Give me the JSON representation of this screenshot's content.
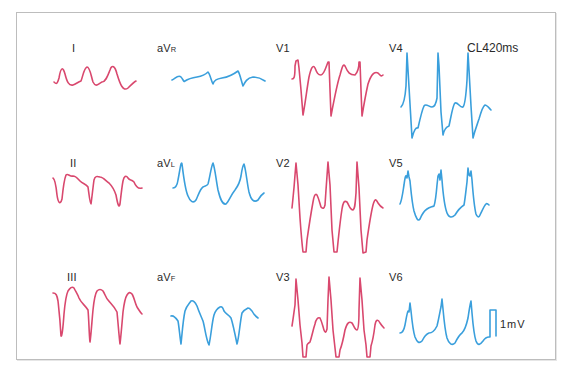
{
  "figure": {
    "cycle_length_label": "CL420ms",
    "calibration_label": "1mV",
    "colors": {
      "limb_and_right_precordial": "#d9486e",
      "augmented_and_left_precordial": "#3a9fdc",
      "frame_border": "#bdbdbd",
      "text": "#2a2a2a"
    }
  },
  "leads": [
    {
      "id": "I",
      "main": "I",
      "sub": "",
      "color": "red"
    },
    {
      "id": "aVR",
      "main": "aV",
      "sub": "R",
      "color": "blue"
    },
    {
      "id": "V1",
      "main": "V1",
      "sub": "",
      "color": "red"
    },
    {
      "id": "V4",
      "main": "V4",
      "sub": "",
      "color": "blue"
    },
    {
      "id": "II",
      "main": "II",
      "sub": "",
      "color": "red"
    },
    {
      "id": "aVL",
      "main": "aV",
      "sub": "L",
      "color": "blue"
    },
    {
      "id": "V2",
      "main": "V2",
      "sub": "",
      "color": "red"
    },
    {
      "id": "V5",
      "main": "V5",
      "sub": "",
      "color": "blue"
    },
    {
      "id": "III",
      "main": "III",
      "sub": "",
      "color": "red"
    },
    {
      "id": "aVF",
      "main": "aV",
      "sub": "F",
      "color": "blue"
    },
    {
      "id": "V3",
      "main": "V3",
      "sub": "",
      "color": "red"
    },
    {
      "id": "V6",
      "main": "V6",
      "sub": "",
      "color": "blue"
    }
  ]
}
